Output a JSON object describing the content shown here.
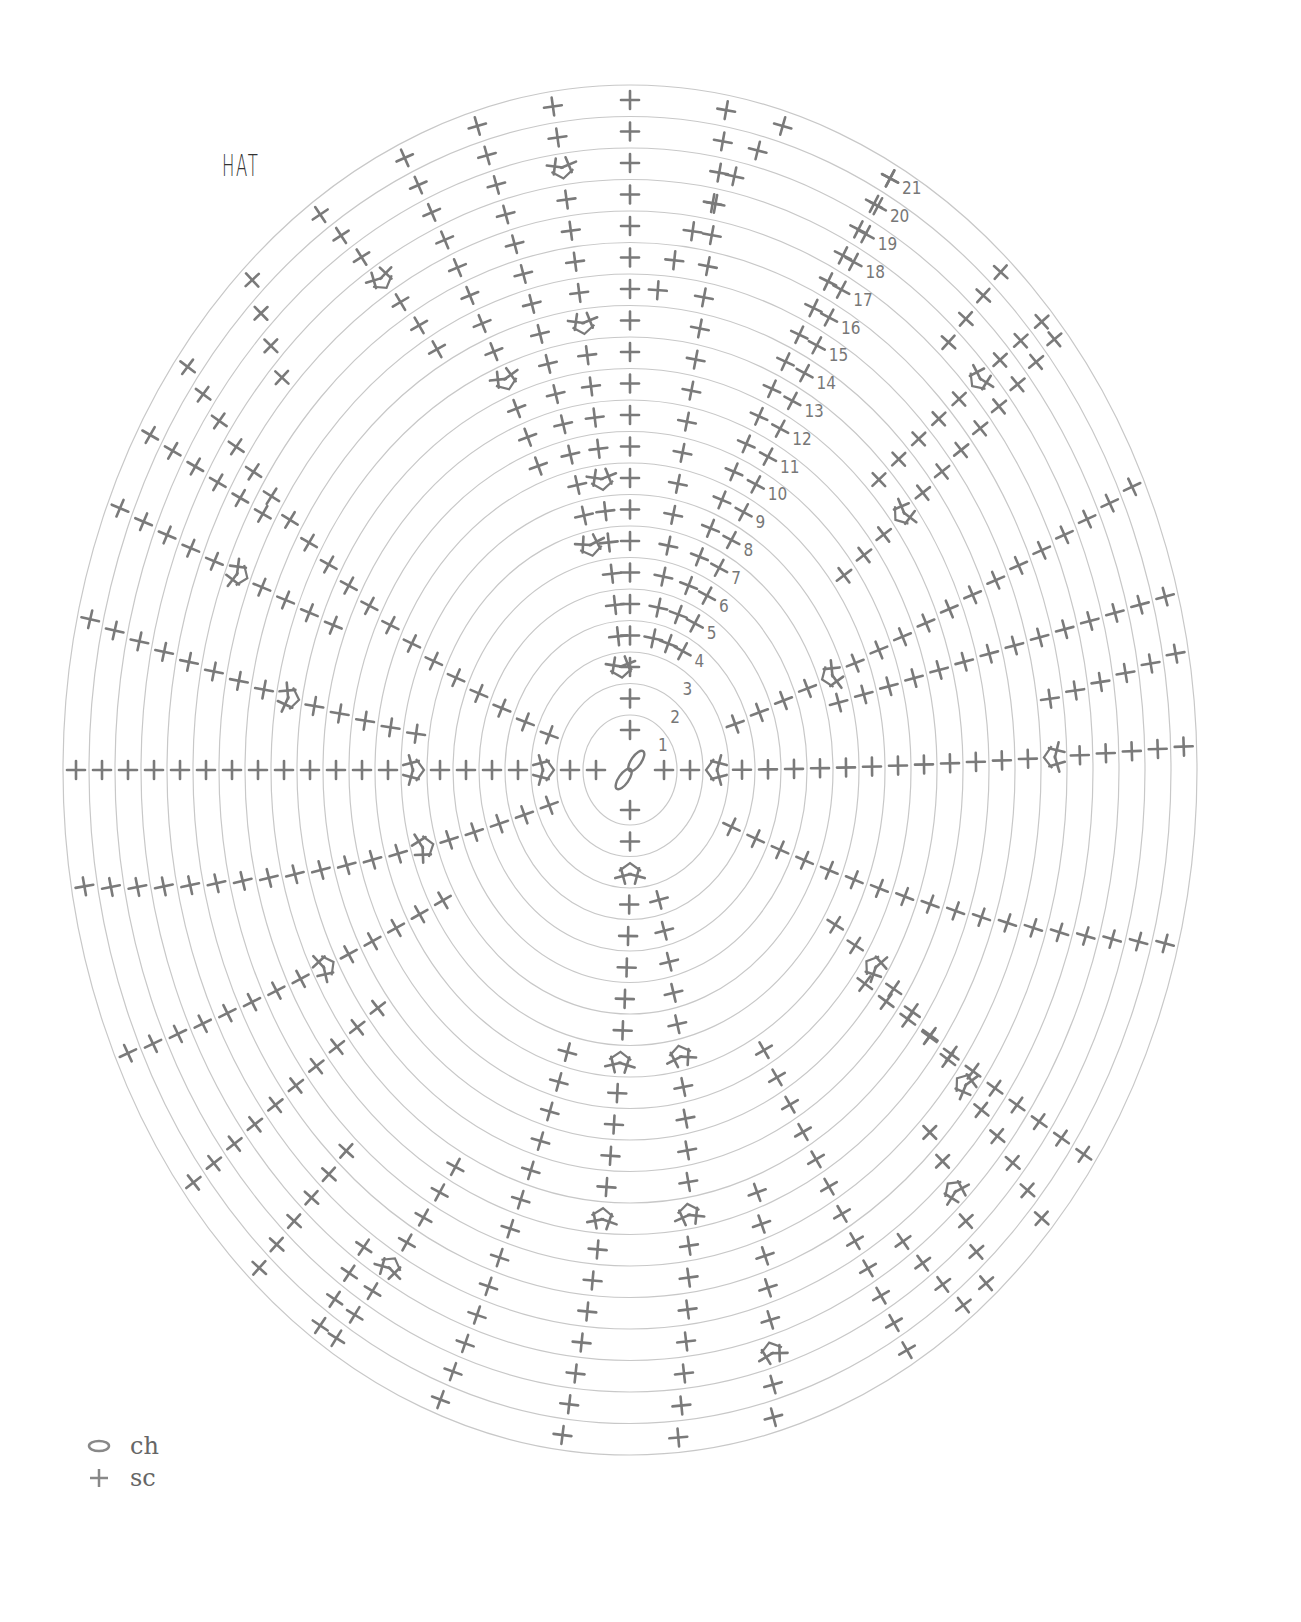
{
  "title": "HAT",
  "diagram": {
    "type": "crochet-round-chart",
    "center": [
      630,
      770
    ],
    "rounds": 21,
    "ring_rx_first": 47,
    "ring_rx_step": 26,
    "ring_ry_first": 55,
    "ring_ry_step": 31.5,
    "ring_color": "#c8c8c8",
    "stitch_color": "#7a7a7a",
    "round_labels": [
      "1",
      "2",
      "3",
      "4",
      "5",
      "6",
      "7",
      "8",
      "9",
      "10",
      "11",
      "12",
      "13",
      "14",
      "15",
      "16",
      "17",
      "18",
      "19",
      "20",
      "21"
    ],
    "label_ray_angle_deg": 62,
    "rays": [
      {
        "from": 1,
        "to": 21,
        "a0": 90,
        "a1": 90,
        "inc": []
      },
      {
        "from": 1,
        "to": 2,
        "a0": 270,
        "a1": 270,
        "inc": []
      },
      {
        "from": 1,
        "to": 2,
        "a0": 180,
        "a1": 180,
        "inc": []
      },
      {
        "from": 1,
        "to": 2,
        "a0": 0,
        "a1": 0,
        "inc": []
      },
      {
        "from": 3,
        "to": 21,
        "a0": 96,
        "a1": 98,
        "inc": [
          3,
          9,
          14,
          19
        ]
      },
      {
        "from": 4,
        "to": 21,
        "a0": 78,
        "a1": 80,
        "inc": []
      },
      {
        "from": 4,
        "to": 21,
        "a0": 70,
        "a1": 62,
        "inc": []
      },
      {
        "from": 7,
        "to": 21,
        "a0": 102,
        "a1": 106,
        "inc": [
          7
        ]
      },
      {
        "from": 10,
        "to": 21,
        "a0": 110,
        "a1": 114,
        "inc": [
          13
        ]
      },
      {
        "from": 15,
        "to": 21,
        "a0": 86,
        "a1": 74,
        "inc": []
      },
      {
        "from": 15,
        "to": 21,
        "a0": 119,
        "a1": 124,
        "inc": [
          18
        ]
      },
      {
        "from": 3,
        "to": 21,
        "a0": 180,
        "a1": 180,
        "inc": [
          3,
          8
        ]
      },
      {
        "from": 3,
        "to": 21,
        "a0": 160,
        "a1": 143,
        "inc": []
      },
      {
        "from": 8,
        "to": 21,
        "a0": 172,
        "a1": 167,
        "inc": [
          13
        ]
      },
      {
        "from": 12,
        "to": 21,
        "a0": 158,
        "a1": 157,
        "inc": [
          16
        ]
      },
      {
        "from": 16,
        "to": 21,
        "a0": 150,
        "a1": 150,
        "inc": []
      },
      {
        "from": 18,
        "to": 21,
        "a0": 137,
        "a1": 133,
        "inc": []
      },
      {
        "from": 3,
        "to": 21,
        "a0": 200,
        "a1": 190,
        "inc": [
          8
        ]
      },
      {
        "from": 8,
        "to": 21,
        "a0": 210,
        "a1": 205,
        "inc": [
          13
        ]
      },
      {
        "from": 12,
        "to": 21,
        "a0": 218,
        "a1": 218,
        "inc": []
      },
      {
        "from": 16,
        "to": 21,
        "a0": 228,
        "a1": 228,
        "inc": []
      },
      {
        "from": 3,
        "to": 21,
        "a0": 270,
        "a1": 263,
        "inc": [
          3,
          9,
          14
        ]
      },
      {
        "from": 9,
        "to": 21,
        "a0": 255,
        "a1": 250,
        "inc": []
      },
      {
        "from": 14,
        "to": 21,
        "a0": 242,
        "a1": 238,
        "inc": [
          18
        ]
      },
      {
        "from": 18,
        "to": 21,
        "a0": 236,
        "a1": 236,
        "inc": []
      },
      {
        "from": 4,
        "to": 21,
        "a0": 285,
        "a1": 275,
        "inc": [
          9,
          14
        ]
      },
      {
        "from": 14,
        "to": 21,
        "a0": 290,
        "a1": 285,
        "inc": [
          19
        ]
      },
      {
        "from": 10,
        "to": 21,
        "a0": 300,
        "a1": 300,
        "inc": []
      },
      {
        "from": 3,
        "to": 21,
        "a0": 0,
        "a1": 2,
        "inc": [
          3,
          16
        ]
      },
      {
        "from": 4,
        "to": 21,
        "a0": 20,
        "a1": 25,
        "inc": [
          8
        ]
      },
      {
        "from": 8,
        "to": 21,
        "a0": 15,
        "a1": 15,
        "inc": []
      },
      {
        "from": 16,
        "to": 21,
        "a0": 8,
        "a1": 10,
        "inc": []
      },
      {
        "from": 4,
        "to": 21,
        "a0": 335,
        "a1": 345,
        "inc": []
      },
      {
        "from": 9,
        "to": 21,
        "a0": 328,
        "a1": 318,
        "inc": [
          11,
          16
        ]
      },
      {
        "from": 11,
        "to": 21,
        "a0": 323,
        "a1": 325,
        "inc": []
      },
      {
        "from": 16,
        "to": 21,
        "a0": 315,
        "a1": 310,
        "inc": [
          18
        ]
      },
      {
        "from": 18,
        "to": 21,
        "a0": 305,
        "a1": 307,
        "inc": []
      },
      {
        "from": 10,
        "to": 21,
        "a0": 37,
        "a1": 40,
        "inc": [
          13
        ]
      },
      {
        "from": 13,
        "to": 21,
        "a0": 44,
        "a1": 42,
        "inc": [
          18
        ]
      },
      {
        "from": 18,
        "to": 21,
        "a0": 48,
        "a1": 48,
        "inc": []
      }
    ]
  },
  "legend": {
    "items": [
      {
        "symbol": "oval",
        "label": "ch"
      },
      {
        "symbol": "plus",
        "label": "sc"
      }
    ]
  }
}
